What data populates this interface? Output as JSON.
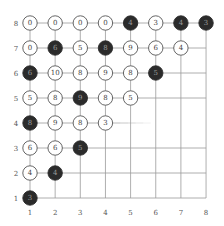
{
  "game": {
    "title": "Grid number puzzle",
    "columns": [
      "1",
      "2",
      "3",
      "4",
      "5",
      "6",
      "7",
      "8"
    ],
    "rows": [
      "1",
      "2",
      "3",
      "4",
      "5",
      "6",
      "7",
      "8"
    ],
    "colors": {
      "grid_line": "#9a9a9a",
      "node_border": "#555555",
      "light_fill": "#ffffff",
      "light_text": "#444444",
      "dark_fill": "#2b2b2b",
      "dark_text": "#9a9a9a",
      "label": "#555555"
    },
    "nodes": [
      {
        "col": 1,
        "row": 8,
        "value": "0",
        "dark": false
      },
      {
        "col": 2,
        "row": 8,
        "value": "0",
        "dark": false
      },
      {
        "col": 3,
        "row": 8,
        "value": "0",
        "dark": false
      },
      {
        "col": 4,
        "row": 8,
        "value": "0",
        "dark": false
      },
      {
        "col": 5,
        "row": 8,
        "value": "4",
        "dark": true
      },
      {
        "col": 6,
        "row": 8,
        "value": "3",
        "dark": false
      },
      {
        "col": 7,
        "row": 8,
        "value": "4",
        "dark": true
      },
      {
        "col": 8,
        "row": 8,
        "value": "3",
        "dark": true
      },
      {
        "col": 1,
        "row": 7,
        "value": "0",
        "dark": false
      },
      {
        "col": 2,
        "row": 7,
        "value": "6",
        "dark": true
      },
      {
        "col": 3,
        "row": 7,
        "value": "5",
        "dark": false
      },
      {
        "col": 4,
        "row": 7,
        "value": "8",
        "dark": true
      },
      {
        "col": 5,
        "row": 7,
        "value": "9",
        "dark": false
      },
      {
        "col": 6,
        "row": 7,
        "value": "6",
        "dark": false
      },
      {
        "col": 7,
        "row": 7,
        "value": "4",
        "dark": false
      },
      {
        "col": 1,
        "row": 6,
        "value": "6",
        "dark": true
      },
      {
        "col": 2,
        "row": 6,
        "value": "10",
        "dark": false
      },
      {
        "col": 3,
        "row": 6,
        "value": "8",
        "dark": false
      },
      {
        "col": 4,
        "row": 6,
        "value": "9",
        "dark": false
      },
      {
        "col": 5,
        "row": 6,
        "value": "8",
        "dark": false
      },
      {
        "col": 6,
        "row": 6,
        "value": "5",
        "dark": true
      },
      {
        "col": 1,
        "row": 5,
        "value": "5",
        "dark": false
      },
      {
        "col": 2,
        "row": 5,
        "value": "8",
        "dark": false
      },
      {
        "col": 3,
        "row": 5,
        "value": "9",
        "dark": true
      },
      {
        "col": 4,
        "row": 5,
        "value": "8",
        "dark": false
      },
      {
        "col": 5,
        "row": 5,
        "value": "5",
        "dark": false
      },
      {
        "col": 1,
        "row": 4,
        "value": "8",
        "dark": true
      },
      {
        "col": 2,
        "row": 4,
        "value": "9",
        "dark": false
      },
      {
        "col": 3,
        "row": 4,
        "value": "8",
        "dark": false
      },
      {
        "col": 4,
        "row": 4,
        "value": "3",
        "dark": false
      },
      {
        "col": 1,
        "row": 3,
        "value": "6",
        "dark": false
      },
      {
        "col": 2,
        "row": 3,
        "value": "6",
        "dark": false
      },
      {
        "col": 3,
        "row": 3,
        "value": "5",
        "dark": true
      },
      {
        "col": 1,
        "row": 2,
        "value": "4",
        "dark": false
      },
      {
        "col": 2,
        "row": 2,
        "value": "4",
        "dark": true
      },
      {
        "col": 1,
        "row": 1,
        "value": "3",
        "dark": true
      }
    ],
    "row4_line_end_col": 5.8
  }
}
